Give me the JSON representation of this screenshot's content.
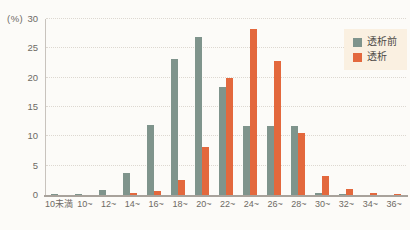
{
  "figure": {
    "unit_label": "(%)",
    "background": "#fcfbf8"
  },
  "legend": {
    "background": "#faf0e1",
    "position": "top-right",
    "items": [
      {
        "label": "透析前",
        "color": "#7f948c"
      },
      {
        "label": "透析",
        "color": "#e3683d"
      }
    ]
  },
  "chart_data": {
    "type": "bar",
    "title": "",
    "xlabel": "",
    "ylabel": "(%)",
    "ylim": [
      0,
      30
    ],
    "yticks": [
      0,
      5,
      10,
      15,
      20,
      25,
      30
    ],
    "grid": true,
    "grid_style": "dotted",
    "legend_position": "top-right",
    "categories": [
      "10未満",
      "10~",
      "12~",
      "14~",
      "16~",
      "18~",
      "20~",
      "22~",
      "24~",
      "26~",
      "28~",
      "30~",
      "32~",
      "34~",
      "36~"
    ],
    "series": [
      {
        "name": "透析前",
        "color": "#7f948c",
        "values": [
          0.1,
          0.2,
          0.9,
          3.7,
          12.0,
          23.2,
          26.9,
          18.4,
          11.7,
          11.7,
          11.8,
          0.3,
          0.1,
          0,
          0
        ]
      },
      {
        "name": "透析",
        "color": "#e3683d",
        "values": [
          0,
          0,
          0,
          0.3,
          0.6,
          2.5,
          8.2,
          20.0,
          28.3,
          22.9,
          10.5,
          3.3,
          1.0,
          0.3,
          0.15
        ]
      }
    ]
  }
}
